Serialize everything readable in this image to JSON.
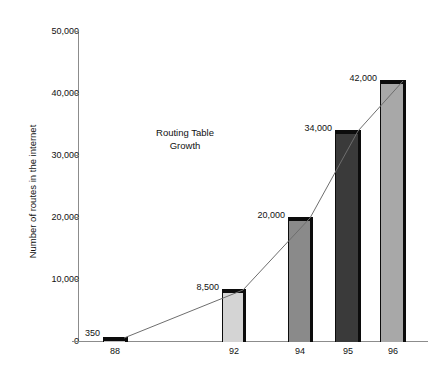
{
  "chart_data": {
    "type": "bar",
    "title": "",
    "annotation": "Routing Table\nGrowth",
    "annotation_line1": "Routing Table",
    "annotation_line2": "Growth",
    "xlabel": "",
    "ylabel": "Number of routes in the internet",
    "categories": [
      "88",
      "92",
      "94",
      "95",
      "96"
    ],
    "values": [
      350,
      8500,
      20000,
      34000,
      42000
    ],
    "value_labels": [
      "350",
      "8,500",
      "20,000",
      "34,000",
      "42,000"
    ],
    "ylim": [
      0,
      50000
    ],
    "ytick_values": [
      0,
      10000,
      20000,
      30000,
      40000,
      50000
    ],
    "ytick_labels": [
      "0",
      "10,000",
      "20,000",
      "30,000",
      "40,000",
      "50,000"
    ],
    "grid": false,
    "legend": false,
    "has_trend_line": true,
    "trend_line_color": "#6e6e6e",
    "bar_edge_color": "#0c0c0c",
    "bar_colors": [
      "#bdbdbd",
      "#d4d4d4",
      "#8a8a8a",
      "#3a3a3a",
      "#a8a8a8"
    ],
    "axis_color": "#8c8c8c",
    "background_color": "#ffffff",
    "text_color": "#111111"
  },
  "bars": [
    {
      "category": "88",
      "value": 350,
      "label": "350",
      "color": "#bdbdbd",
      "x": 103,
      "width": 25,
      "top": 337,
      "height": 5,
      "label_x": 72,
      "label_y": 329,
      "label_w": 28
    },
    {
      "category": "92",
      "value": 8500,
      "label": "8,500",
      "color": "#d4d4d4",
      "x": 222,
      "width": 24,
      "top": 289,
      "height": 53,
      "label_x": 181,
      "label_y": 283,
      "label_w": 38
    },
    {
      "category": "94",
      "value": 20000,
      "label": "20,000",
      "color": "#8a8a8a",
      "x": 288,
      "width": 25,
      "top": 217,
      "height": 125,
      "label_x": 243,
      "label_y": 211,
      "label_w": 42
    },
    {
      "category": "95",
      "value": 34000,
      "label": "34,000",
      "color": "#3a3a3a",
      "x": 335,
      "width": 26,
      "top": 130,
      "height": 212,
      "label_x": 290,
      "label_y": 124,
      "label_w": 42
    },
    {
      "category": "96",
      "value": 42000,
      "label": "42,000",
      "color": "#a8a8a8",
      "x": 380,
      "width": 26,
      "top": 80,
      "height": 262,
      "label_x": 335,
      "label_y": 74,
      "label_w": 42
    }
  ],
  "y_ticks": [
    {
      "label": "50,000",
      "value": 50000,
      "y": 31
    },
    {
      "label": "40,000",
      "value": 40000,
      "y": 93
    },
    {
      "label": "30,000",
      "value": 30000,
      "y": 155
    },
    {
      "label": "20,000",
      "value": 20000,
      "y": 217
    },
    {
      "label": "10,000",
      "value": 10000,
      "y": 279
    },
    {
      "label": "0",
      "value": 0,
      "y": 341
    }
  ],
  "x_ticks": [
    {
      "label": "88",
      "center": 115
    },
    {
      "label": "92",
      "center": 234
    },
    {
      "label": "94",
      "center": 300
    },
    {
      "label": "95",
      "center": 348
    },
    {
      "label": "96",
      "center": 393
    }
  ],
  "trend_points": [
    {
      "x": 124,
      "y": 338
    },
    {
      "x": 243,
      "y": 290
    },
    {
      "x": 310,
      "y": 218
    },
    {
      "x": 358,
      "y": 131
    },
    {
      "x": 403,
      "y": 81
    }
  ]
}
